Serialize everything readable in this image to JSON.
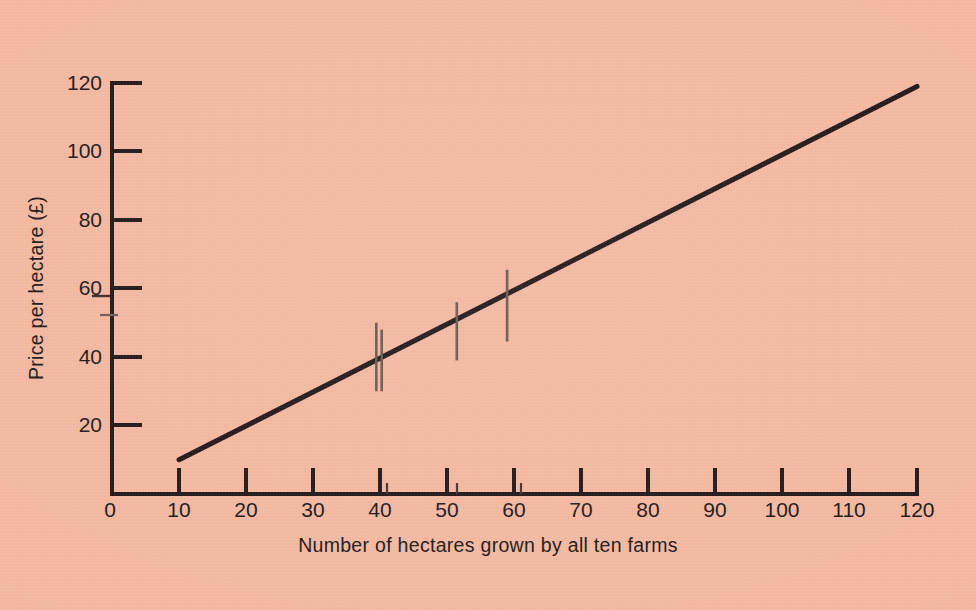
{
  "figure": {
    "background_color": "#f6b9a2",
    "ink_color": "#22181a",
    "marker_color": "#6b5a52",
    "width": 976,
    "height": 610
  },
  "chart_data": {
    "type": "line",
    "title": "",
    "subtitle": "",
    "xlabel": "Number of hectares grown by all ten farms",
    "ylabel": "Price per hectare (£)",
    "xlim": [
      0,
      120
    ],
    "ylim": [
      0,
      120
    ],
    "grid": false,
    "legend": false,
    "legend_position": "none",
    "xticks": [
      0,
      10,
      20,
      30,
      40,
      50,
      60,
      70,
      80,
      90,
      100,
      110,
      120
    ],
    "xtick_labels": [
      "0",
      "10",
      "20",
      "30",
      "40",
      "50",
      "60",
      "70",
      "80",
      "90",
      "100",
      "110",
      "120"
    ],
    "yticks": [
      0,
      20,
      40,
      60,
      80,
      100,
      120
    ],
    "ytick_labels": [
      "0",
      "20",
      "40",
      "60",
      "80",
      "100",
      "120"
    ],
    "ytick_labels_shown": [
      "20",
      "40",
      "60",
      "80",
      "100",
      "120"
    ],
    "series": [
      {
        "name": "Supply curve",
        "type": "line",
        "x": [
          10,
          120
        ],
        "y": [
          10,
          119
        ],
        "linewidth": 5,
        "color": "#22181a"
      }
    ],
    "markers": [
      {
        "name": "marker-1a",
        "x": 39.4,
        "y": 40.0,
        "half_height": 10.0
      },
      {
        "name": "marker-1b",
        "x": 40.2,
        "y": 39.0,
        "half_height": 9.0
      },
      {
        "name": "marker-2",
        "x": 51.4,
        "y": 47.5,
        "half_height": 8.5
      },
      {
        "name": "marker-3",
        "x": 58.9,
        "y": 55.0,
        "half_height": 10.5
      }
    ],
    "minor_x_axis_marks": [
      41.0,
      51.5,
      61.0
    ],
    "annotations": [
      {
        "name": "y-axis-minor-mark",
        "axis": "y",
        "value": 52
      },
      {
        "name": "y-tick-60-underscore",
        "axis": "y",
        "value": 60
      }
    ]
  },
  "axes": {
    "x_axis_name": "x-axis",
    "y_axis_name": "y-axis"
  }
}
